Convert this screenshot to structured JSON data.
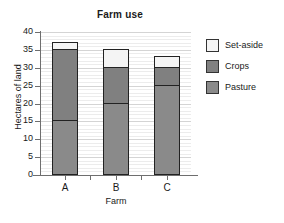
{
  "chart_data": {
    "type": "bar",
    "subtype": "stacked",
    "title": "Farm use",
    "xlabel": "Farm",
    "ylabel": "Hectares of land",
    "categories": [
      "A",
      "B",
      "C"
    ],
    "series": [
      {
        "name": "Pasture",
        "values": [
          15,
          20,
          25
        ],
        "color": "#8a8a8a"
      },
      {
        "name": "Crops",
        "values": [
          20,
          10,
          5
        ],
        "color": "#808080"
      },
      {
        "name": "Set-aside",
        "values": [
          2,
          5,
          3
        ],
        "color": "#f4f4f4"
      }
    ],
    "stack_tops": {
      "A": {
        "pasture": 15,
        "crops": 35,
        "set_aside": 37
      },
      "B": {
        "pasture": 20,
        "crops": 30,
        "set_aside": 35
      },
      "C": {
        "pasture": 25,
        "crops": 30,
        "set_aside": 33
      }
    },
    "totals": [
      37,
      35,
      33
    ],
    "ylim": [
      0,
      40
    ],
    "ytick_values": [
      0,
      5,
      10,
      15,
      20,
      25,
      30,
      35,
      40
    ],
    "ytick_labels": [
      "0",
      "5",
      "10",
      "15",
      "20",
      "25",
      "30",
      "35",
      "40"
    ],
    "ytick_step": 5,
    "minor_gridline_step": 1,
    "grid": true,
    "legend_position": "right",
    "legend_order": [
      "Set-aside",
      "Crops",
      "Pasture"
    ]
  },
  "legend": {
    "items": [
      {
        "label": "Set-aside",
        "color": "#f4f4f4"
      },
      {
        "label": "Crops",
        "color": "#808080"
      },
      {
        "label": "Pasture",
        "color": "#8a8a8a"
      }
    ]
  }
}
